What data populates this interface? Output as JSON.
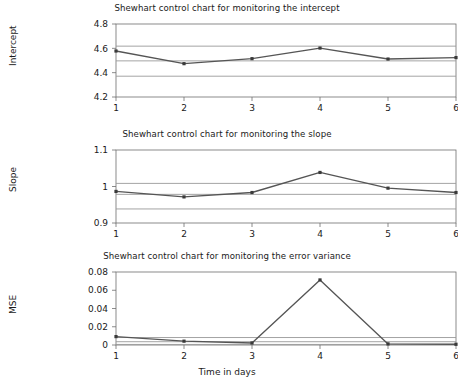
{
  "figure": {
    "xlabel": "Time in days",
    "width": 454,
    "height": 380
  },
  "colors": {
    "series_line": "#555555",
    "marker": "#3a3a3a",
    "limit_line": "#9a9a9a",
    "center_line": "#9a9a9a",
    "axis": "#6e6e6e",
    "text": "#1a1a1a",
    "background": "#ffffff"
  },
  "chart_data": [
    {
      "id": "intercept",
      "type": "line",
      "title": "Shewhart control chart for monitoring the intercept",
      "xlabel": "",
      "ylabel": "Intercept",
      "x": [
        1,
        2,
        3,
        4,
        5,
        6
      ],
      "categories": [
        "1",
        "2",
        "3",
        "4",
        "5",
        "6"
      ],
      "values": [
        4.578,
        4.474,
        4.515,
        4.602,
        4.512,
        4.524
      ],
      "series": [
        {
          "name": "Intercept",
          "values": [
            4.578,
            4.474,
            4.515,
            4.602,
            4.512,
            4.524
          ]
        }
      ],
      "xlim": [
        1,
        6
      ],
      "ylim": [
        4.2,
        4.8
      ],
      "yticks": [
        4.2,
        4.4,
        4.6,
        4.8
      ],
      "ytick_labels": [
        "4.2",
        "4.4",
        "4.6",
        "4.8"
      ],
      "xticks": [
        1,
        2,
        3,
        4,
        5,
        6
      ],
      "xtick_labels": [
        "1",
        "2",
        "3",
        "4",
        "5",
        "6"
      ],
      "control_limits": {
        "ucl": 4.618,
        "center": 4.497,
        "lcl": 4.371
      },
      "grid": false,
      "legend": "none",
      "markers": true
    },
    {
      "id": "slope",
      "type": "line",
      "title": "Shewhart control chart for monitoring the slope",
      "xlabel": "",
      "ylabel": "Slope",
      "x": [
        1,
        2,
        3,
        4,
        5,
        6
      ],
      "categories": [
        "1",
        "2",
        "3",
        "4",
        "5",
        "6"
      ],
      "values": [
        0.9865,
        0.9715,
        0.9835,
        1.0385,
        0.9955,
        0.9835
      ],
      "series": [
        {
          "name": "Slope",
          "values": [
            0.9865,
            0.9715,
            0.9835,
            1.0385,
            0.9955,
            0.9835
          ]
        }
      ],
      "xlim": [
        1,
        6
      ],
      "ylim": [
        0.9,
        1.1
      ],
      "yticks": [
        0.9,
        1.0,
        1.1
      ],
      "ytick_labels": [
        "0.9",
        "1",
        "1.1"
      ],
      "xticks": [
        1,
        2,
        3,
        4,
        5,
        6
      ],
      "xtick_labels": [
        "1",
        "2",
        "3",
        "4",
        "5",
        "6"
      ],
      "control_limits": {
        "ucl": 1.0085,
        "center": 0.9785,
        "lcl": 0.9385
      },
      "grid": false,
      "legend": "none",
      "markers": true
    },
    {
      "id": "mse",
      "type": "line",
      "title": "Shewhart control chart for monitoring the error variance",
      "xlabel": "Time in days",
      "ylabel": "MSE",
      "x": [
        1,
        2,
        3,
        4,
        5,
        6
      ],
      "categories": [
        "1",
        "2",
        "3",
        "4",
        "5",
        "6"
      ],
      "values": [
        0.0092,
        0.0042,
        0.0022,
        0.0713,
        0.0012,
        0.0008
      ],
      "series": [
        {
          "name": "MSE",
          "values": [
            0.0092,
            0.0042,
            0.0022,
            0.0713,
            0.0012,
            0.0008
          ]
        }
      ],
      "xlim": [
        1,
        6
      ],
      "ylim": [
        0,
        0.08
      ],
      "yticks": [
        0,
        0.02,
        0.04,
        0.06,
        0.08
      ],
      "ytick_labels": [
        "0",
        "0.02",
        "0.04",
        "0.06",
        "0.08"
      ],
      "xticks": [
        1,
        2,
        3,
        4,
        5,
        6
      ],
      "xtick_labels": [
        "1",
        "2",
        "3",
        "4",
        "5",
        "6"
      ],
      "control_limits": {
        "ucl": 0.0082,
        "center": 0.0036,
        "lcl": 0.0006
      },
      "grid": false,
      "legend": "none",
      "markers": true
    }
  ]
}
